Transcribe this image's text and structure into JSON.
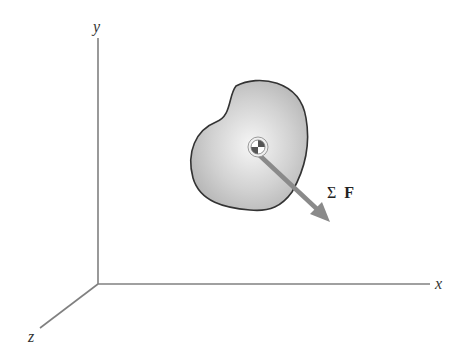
{
  "diagram": {
    "axes": {
      "x_label": "x",
      "y_label": "y",
      "z_label": "z",
      "color": "#7a7a7a"
    },
    "body": {
      "fill_center": "#f4f4f4",
      "fill_edge": "#b5b5b5",
      "outline": "#333333"
    },
    "center_of_mass": {
      "symbol": "center-of-mass-marker"
    },
    "force": {
      "sigma": "Σ",
      "symbol": "F",
      "arrow_color": "#8a8a8a"
    }
  }
}
